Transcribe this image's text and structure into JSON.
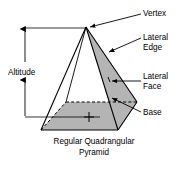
{
  "figure": {
    "caption_line1": "Regular Quadrangular",
    "caption_line2": "Pyramid",
    "labels": {
      "vertex": "Vertex",
      "lateral_edge_line1": "Lateral",
      "lateral_edge_line2": "Edge",
      "lateral_face_line1": "Lateral",
      "lateral_face_line2": "Face",
      "base": "Base",
      "altitude": "Altitude"
    },
    "colors": {
      "stroke": "#000000",
      "base_fill": "#b4b4b4",
      "background": "#ffffff",
      "hidden_edge": "#000000"
    },
    "geometry": {
      "apex": [
        86,
        27
      ],
      "base_front_left": [
        41,
        130
      ],
      "base_front_right": [
        118,
        130
      ],
      "base_back_right": [
        137,
        102
      ],
      "base_back_left": [
        66,
        102
      ],
      "base_center_mark": [
        89,
        117
      ],
      "altitude_axis_x": 25,
      "altitude_top_y": 28,
      "altitude_bottom_y": 117
    }
  }
}
